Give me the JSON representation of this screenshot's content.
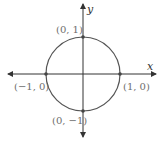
{
  "diagram": {
    "type": "unit-circle",
    "axes": {
      "x_label": "x",
      "y_label": "y"
    },
    "points": [
      {
        "label": "(0, 1)",
        "x": 0,
        "y": 1
      },
      {
        "label": "(−1, 0)",
        "x": -1,
        "y": 0
      },
      {
        "label": "(1, 0)",
        "x": 1,
        "y": 0
      },
      {
        "label": "(0, −1)",
        "x": 0,
        "y": -1
      }
    ],
    "colors": {
      "circle": "#555555",
      "axes": "#333333",
      "labels": "#6e6e6e"
    }
  }
}
